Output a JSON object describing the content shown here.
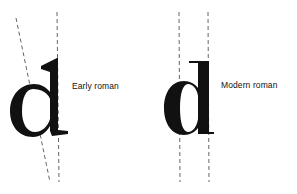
{
  "figure": {
    "panels": [
      {
        "label": "Early roman",
        "glyph": "d",
        "stress": "oblique",
        "axis_lines": "one slanted, one vertical"
      },
      {
        "label": "Modern roman",
        "glyph": "d",
        "stress": "vertical",
        "axis_lines": "two vertical parallel"
      }
    ],
    "colors": {
      "ink": "#111111",
      "background": "#ffffff",
      "guide": "#555555"
    }
  }
}
